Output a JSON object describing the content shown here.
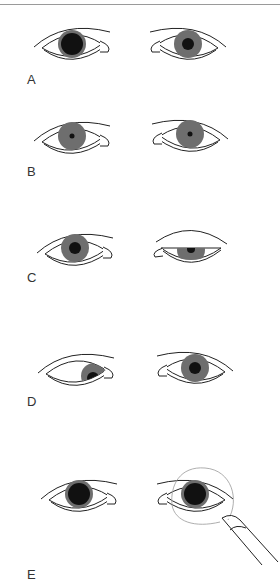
{
  "figure": {
    "panels": [
      {
        "label": "A",
        "description": "Anisocoria: left pupil dilated, right pupil smaller"
      },
      {
        "label": "B",
        "description": "Both pupils constricted (pinpoint)"
      },
      {
        "label": "C",
        "description": "Ptosis of right eyelid"
      },
      {
        "label": "D",
        "description": "Left eye deviated inward/downward"
      },
      {
        "label": "E",
        "description": "Light directed into right eye with penlight"
      }
    ]
  },
  "colors": {
    "iris": "#6e6e6e",
    "pupil": "#111111",
    "outline": "#222222",
    "light_beam": "#999999",
    "top_border": "#9a9a9a"
  }
}
